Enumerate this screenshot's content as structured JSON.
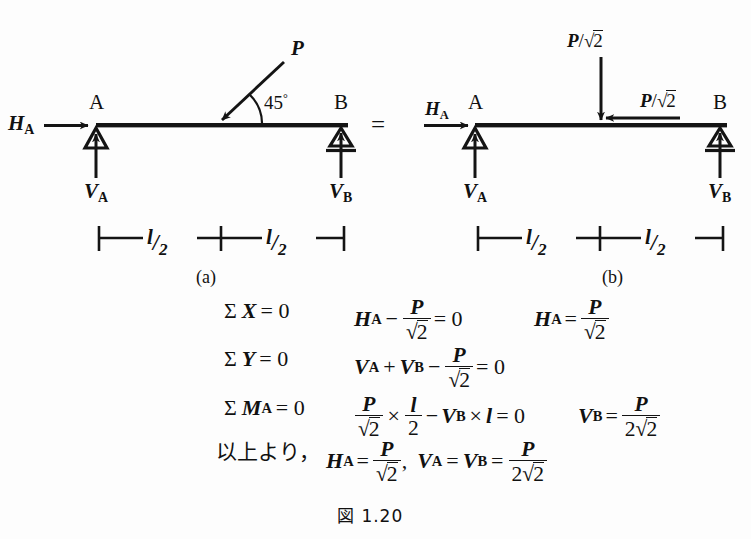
{
  "figure": {
    "caption": "図 1.20",
    "background_color": "#fdfdfd",
    "ink_color": "#141414",
    "equals_sign": "="
  },
  "panel_a": {
    "label": "(a)",
    "node_left": "A",
    "node_right": "B",
    "reaction_horizontal": "H",
    "reaction_horizontal_sub": "A",
    "reaction_vertical_left": "V",
    "reaction_vertical_left_sub": "A",
    "reaction_vertical_right": "V",
    "reaction_vertical_right_sub": "B",
    "applied_load": "P",
    "angle": "45",
    "angle_unit": "°",
    "dim_left": {
      "numerator": "l",
      "slash": "/",
      "denominator": "2"
    },
    "dim_right": {
      "numerator": "l",
      "slash": "/",
      "denominator": "2"
    },
    "support_left_type": "pin",
    "support_right_type": "roller"
  },
  "panel_b": {
    "label": "(b)",
    "node_left": "A",
    "node_right": "B",
    "reaction_horizontal": "H",
    "reaction_horizontal_sub": "A",
    "reaction_vertical_left": "V",
    "reaction_vertical_left_sub": "A",
    "reaction_vertical_right": "V",
    "reaction_vertical_right_sub": "B",
    "load_vertical": {
      "symbol": "P",
      "slash": "/",
      "radical": "√",
      "radicand": "2"
    },
    "load_horizontal": {
      "symbol": "P",
      "slash": "/",
      "radical": "√",
      "radicand": "2"
    },
    "dim_left": {
      "numerator": "l",
      "slash": "/",
      "denominator": "2"
    },
    "dim_right": {
      "numerator": "l",
      "slash": "/",
      "denominator": "2"
    },
    "support_left_type": "pin",
    "support_right_type": "roller"
  },
  "equations": {
    "row1": {
      "condition_sigma": "Σ",
      "condition_var": "X",
      "condition_eq": "= 0",
      "expr_lead_var": "H",
      "expr_lead_sub": "A",
      "expr_minus": "−",
      "expr_frac_num": "P",
      "expr_frac_radical": "√",
      "expr_frac_radicand": "2",
      "expr_tail": "= 0",
      "result_var": "H",
      "result_sub": "A",
      "result_eq": "=",
      "result_frac_num": "P",
      "result_frac_radical": "√",
      "result_frac_radicand": "2"
    },
    "row2": {
      "condition_sigma": "Σ",
      "condition_var": "Y",
      "condition_eq": "= 0",
      "term1_var": "V",
      "term1_sub": "A",
      "plus": "+",
      "term2_var": "V",
      "term2_sub": "B",
      "minus": "−",
      "frac_num": "P",
      "frac_radical": "√",
      "frac_radicand": "2",
      "tail": "= 0"
    },
    "row3": {
      "condition_sigma": "Σ",
      "condition_var": "M",
      "condition_sub": "A",
      "condition_eq": "= 0",
      "frac1_num": "P",
      "frac1_radical": "√",
      "frac1_radicand": "2",
      "times1": "×",
      "frac2_num": "l",
      "frac2_den": "2",
      "minus": "−",
      "term_var": "V",
      "term_sub": "B",
      "times2": "×",
      "term_len": "l",
      "tail": "= 0",
      "result_var": "V",
      "result_sub": "B",
      "result_eq": "=",
      "result_frac_num": "P",
      "result_frac_den_coef": "2",
      "result_frac_radical": "√",
      "result_frac_radicand": "2"
    },
    "row4": {
      "intro": "以上より，",
      "term1_var": "H",
      "term1_sub": "A",
      "term1_eq": "=",
      "term1_frac_num": "P",
      "term1_frac_radical": "√",
      "term1_frac_radicand": "2",
      "comma": ",",
      "term2_var": "V",
      "term2_sub": "A",
      "term2_eq": "=",
      "term3_var": "V",
      "term3_sub": "B",
      "term3_eq": "=",
      "term3_frac_num": "P",
      "term3_frac_den_coef": "2",
      "term3_frac_radical": "√",
      "term3_frac_radicand": "2"
    }
  }
}
